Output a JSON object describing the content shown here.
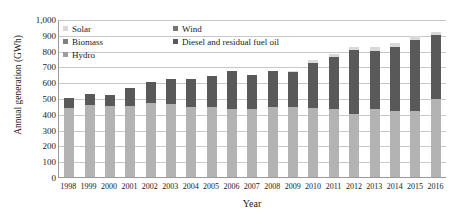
{
  "chart_data": {
    "type": "bar",
    "stacked": true,
    "title": "",
    "xlabel": "Year",
    "ylabel": "Annual generation (GWh)",
    "ylim": [
      0,
      1000
    ],
    "ytick_step": 100,
    "ytick_labels": [
      "1,000",
      "900",
      "800",
      "700",
      "600",
      "500",
      "400",
      "300",
      "200",
      "100",
      "0"
    ],
    "grid": true,
    "legend_position": "top-left-inside",
    "categories": [
      "1998",
      "1999",
      "2000",
      "2001",
      "2002",
      "2003",
      "2004",
      "2005",
      "2006",
      "2007",
      "2008",
      "2009",
      "2010",
      "2011",
      "2012",
      "2013",
      "2014",
      "2015",
      "2016"
    ],
    "series": [
      {
        "name": "Hydro",
        "color": "#b3b3b3",
        "values": [
          437,
          455,
          450,
          450,
          470,
          465,
          440,
          440,
          432,
          432,
          443,
          443,
          435,
          432,
          400,
          430,
          420,
          415,
          495
        ]
      },
      {
        "name": "Diesel and residual fuel oil",
        "color": "#595959",
        "values": [
          63,
          72,
          70,
          115,
          130,
          155,
          180,
          200,
          240,
          212,
          230,
          222,
          288,
          330,
          405,
          370,
          400,
          450,
          405
        ]
      },
      {
        "name": "Biomass",
        "color": "#808080",
        "values": [
          0,
          0,
          0,
          0,
          0,
          0,
          0,
          0,
          0,
          0,
          0,
          0,
          0,
          0,
          0,
          0,
          0,
          0,
          0
        ]
      },
      {
        "name": "Wind",
        "color": "#757575",
        "values": [
          0,
          0,
          0,
          0,
          0,
          0,
          0,
          0,
          0,
          0,
          0,
          0,
          0,
          0,
          0,
          0,
          0,
          0,
          0
        ]
      },
      {
        "name": "Solar",
        "color": "#d9d9d9",
        "values": [
          0,
          0,
          0,
          0,
          0,
          0,
          0,
          0,
          0,
          0,
          0,
          8,
          15,
          18,
          15,
          25,
          30,
          25,
          20
        ]
      }
    ],
    "totals": [
      500,
      527,
      520,
      565,
      600,
      620,
      620,
      640,
      672,
      644,
      673,
      673,
      738,
      780,
      820,
      825,
      850,
      890,
      920
    ],
    "legend": [
      {
        "label": "Solar",
        "color": "#d9d9d9"
      },
      {
        "label": "Wind",
        "color": "#757575"
      },
      {
        "label": "Biomass",
        "color": "#808080"
      },
      {
        "label": "Diesel and residual fuel oil",
        "color": "#595959"
      },
      {
        "label": "Hydro",
        "color": "#9e9e9e"
      }
    ]
  }
}
